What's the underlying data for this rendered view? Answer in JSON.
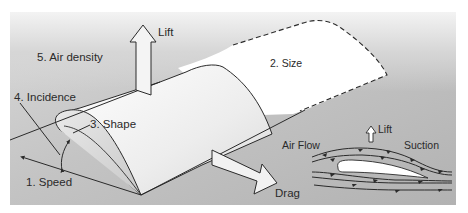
{
  "diagram": {
    "type": "aerofoil-lift-factors",
    "labels": {
      "speed": "1. Speed",
      "size": "2. Size",
      "shape": "3. Shape",
      "incidence": "4. Incidence",
      "air_density": "5. Air density",
      "lift_main": "Lift",
      "drag": "Drag"
    },
    "inset": {
      "air_flow": "Air Flow",
      "lift": "Lift",
      "suction": "Suction"
    },
    "colors": {
      "panel_dark": "#b9b9b9",
      "panel_light": "#efefef",
      "wing_fill": "#f4f4f4",
      "arrow_fill": "#f2f2f2",
      "stroke": "#2a2a2a"
    }
  }
}
